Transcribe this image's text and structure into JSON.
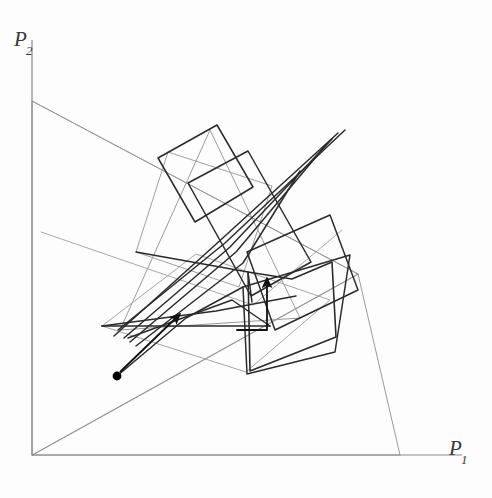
{
  "figure": {
    "background_color": "#fdfdfd",
    "width": 492,
    "height": 498,
    "axis_color": "#8a8a8a",
    "light_line_color": "#9a9a9a",
    "dark_line_color": "#2b2b2b",
    "marker_color": "#000000"
  },
  "axes": {
    "x_label": "P",
    "x_label_sub": "1",
    "y_label": "P",
    "y_label_sub": "2",
    "origin": {
      "x": 32,
      "y": 455
    },
    "x_axis_end": {
      "x": 462,
      "y": 455
    },
    "y_axis_end": {
      "x": 32,
      "y": 40
    },
    "x_label_pos": {
      "x": 449,
      "y": 455
    },
    "y_label_pos": {
      "x": 14,
      "y": 46
    }
  },
  "chart_data": {
    "type": "line",
    "xlabel": "P1",
    "ylabel": "P2",
    "grid": false,
    "legend": "none",
    "xlim": [
      0,
      462
    ],
    "ylim": [
      0,
      455
    ],
    "feasible_region": {
      "name": "constraint-triangle",
      "stroke": "#9a9a9a",
      "points": [
        [
          32,
          455
        ],
        [
          32,
          101
        ],
        [
          358,
          274
        ]
      ]
    },
    "constraint_rays": [
      {
        "name": "ray-lower",
        "points": [
          [
            32,
            455
          ],
          [
            400,
            455
          ]
        ]
      },
      {
        "name": "ray-diagonal-right",
        "points": [
          [
            32,
            455
          ],
          [
            358,
            274
          ]
        ]
      },
      {
        "name": "ray-upper",
        "points": [
          [
            32,
            101
          ],
          [
            358,
            274
          ]
        ]
      },
      {
        "name": "ray-to-xaxis",
        "points": [
          [
            358,
            274
          ],
          [
            400,
            455
          ]
        ]
      }
    ],
    "light_polygons": [
      {
        "name": "light-triangle-apex",
        "stroke": "#9a9a9a",
        "points": [
          [
            210,
            130
          ],
          [
            120,
            330
          ],
          [
            300,
            318
          ],
          [
            210,
            130
          ]
        ]
      },
      {
        "name": "light-quad-mid",
        "stroke": "#a0a0a0",
        "points": [
          [
            168,
            152
          ],
          [
            272,
            186
          ],
          [
            239,
            287
          ],
          [
            136,
            252
          ],
          [
            168,
            152
          ]
        ]
      },
      {
        "name": "light-band-lower",
        "stroke": "#a5a5a5",
        "points": [
          [
            102,
            326
          ],
          [
            246,
            372
          ],
          [
            330,
            300
          ],
          [
            196,
            254
          ],
          [
            102,
            326
          ]
        ]
      },
      {
        "name": "light-sweep",
        "stroke": "#a8a8a8",
        "points": [
          [
            41,
            232
          ],
          [
            253,
            305
          ],
          [
            342,
            230
          ]
        ]
      }
    ],
    "dark_polygons": [
      {
        "name": "simplex-square-left",
        "stroke": "#2b2b2b",
        "width": 1.5,
        "points": [
          [
            158,
            158
          ],
          [
            217,
            125
          ],
          [
            253,
            187
          ],
          [
            195,
            222
          ],
          [
            158,
            158
          ]
        ]
      },
      {
        "name": "simplex-square-mid",
        "stroke": "#2b2b2b",
        "width": 1.5,
        "points": [
          [
            188,
            183
          ],
          [
            248,
            151
          ],
          [
            311,
            262
          ],
          [
            251,
            296
          ],
          [
            188,
            183
          ]
        ]
      },
      {
        "name": "simplex-square-right",
        "stroke": "#2b2b2b",
        "width": 1.5,
        "points": [
          [
            247,
            252
          ],
          [
            330,
            215
          ],
          [
            358,
            290
          ],
          [
            275,
            330
          ],
          [
            247,
            252
          ]
        ]
      },
      {
        "name": "simplex-pentagon",
        "stroke": "#2b2b2b",
        "width": 1.6,
        "points": [
          [
            248,
            272
          ],
          [
            292,
            279
          ],
          [
            332,
            262
          ],
          [
            336,
            337
          ],
          [
            250,
            371
          ],
          [
            248,
            272
          ]
        ]
      },
      {
        "name": "simplex-lower-quad",
        "stroke": "#2b2b2b",
        "width": 1.5,
        "points": [
          [
            243,
            287
          ],
          [
            350,
            255
          ],
          [
            335,
            352
          ],
          [
            247,
            374
          ],
          [
            243,
            287
          ]
        ]
      }
    ],
    "dark_paths": [
      {
        "name": "convergence-fan-1",
        "points": [
          [
            345,
            130
          ],
          [
            225,
            243
          ],
          [
            118,
            330
          ]
        ]
      },
      {
        "name": "convergence-fan-2",
        "points": [
          [
            338,
            133
          ],
          [
            214,
            246
          ],
          [
            114,
            336
          ]
        ]
      },
      {
        "name": "convergence-fan-3",
        "points": [
          [
            332,
            139
          ],
          [
            230,
            247
          ],
          [
            124,
            338
          ]
        ]
      },
      {
        "name": "convergence-fan-4",
        "points": [
          [
            326,
            145
          ],
          [
            236,
            252
          ],
          [
            130,
            342
          ]
        ]
      },
      {
        "name": "convergence-fan-5",
        "points": [
          [
            300,
            171
          ],
          [
            243,
            263
          ],
          [
            136,
            346
          ]
        ]
      },
      {
        "name": "long-horizontal-step",
        "points": [
          [
            102,
            326
          ],
          [
            270,
            326
          ]
        ]
      },
      {
        "name": "zigzag-step-a",
        "points": [
          [
            102,
            326
          ],
          [
            216,
            311
          ],
          [
            296,
            296
          ]
        ]
      },
      {
        "name": "zigzag-step-b",
        "points": [
          [
            136,
            252
          ],
          [
            248,
            272
          ],
          [
            252,
            302
          ]
        ]
      },
      {
        "name": "zigzag-step-c",
        "points": [
          [
            128,
            338
          ],
          [
            232,
            300
          ],
          [
            270,
            326
          ]
        ]
      },
      {
        "name": "zigzag-step-d",
        "points": [
          [
            117,
            376
          ],
          [
            186,
            318
          ],
          [
            243,
            287
          ]
        ]
      }
    ],
    "annotations": [
      {
        "name": "start-marker",
        "type": "dot",
        "point": [
          117,
          376
        ],
        "radius": 4.4,
        "fill": "#000000",
        "label": "start point"
      },
      {
        "name": "path-arrow",
        "type": "arrow",
        "from": [
          120,
          372
        ],
        "to": [
          180,
          314
        ],
        "label": "search direction"
      },
      {
        "name": "vertical-step-arrow",
        "type": "arrow",
        "from": [
          267,
          330
        ],
        "to": [
          267,
          278
        ],
        "label": "final step direction"
      },
      {
        "name": "vertical-step-base",
        "type": "elbow",
        "points": [
          [
            237,
            330
          ],
          [
            267,
            330
          ]
        ],
        "label": "step base"
      }
    ]
  }
}
